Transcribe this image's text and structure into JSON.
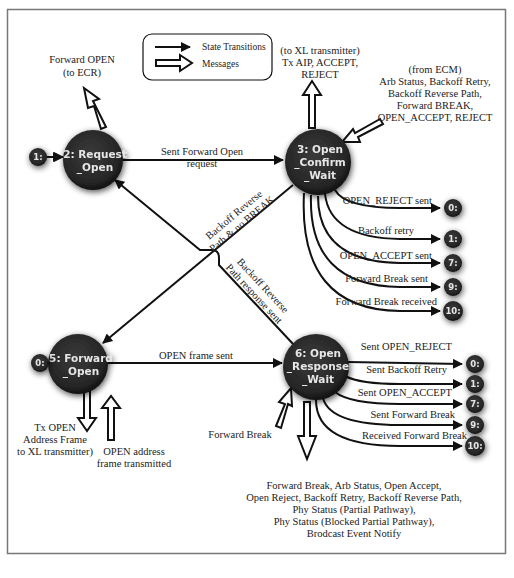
{
  "legend": {
    "state_transitions": "State Transitions",
    "messages": "Messages"
  },
  "states": {
    "request_open": {
      "line1": "2: Request",
      "line2": "_Open"
    },
    "open_confirm_wait": {
      "line1": "3: Open",
      "line2": "_Confirm",
      "line3": "_Wait"
    },
    "forward_open": {
      "line1": "5: Forward",
      "line2": "_Open"
    },
    "open_response_wait": {
      "line1": "6: Open",
      "line2": "_Response",
      "line3": "_Wait"
    }
  },
  "entry_states": {
    "to_request_open": "1:",
    "to_forward_open": "0:"
  },
  "transitions": {
    "request_to_confirm": {
      "line1": "Sent Forward Open",
      "line2": "request"
    },
    "confirm_to_forward": {
      "line1": "Backoff Reverse",
      "line2": "Path & no BREAK"
    },
    "response_to_request": {
      "line1": "Backoff Reverse",
      "line2": "Path response sent"
    },
    "forward_to_response": "OPEN frame sent"
  },
  "confirm_exits": [
    {
      "label": "OPEN_REJECT sent",
      "target": "0:"
    },
    {
      "label": "Backoff retry",
      "target": "1:"
    },
    {
      "label": "OPEN_ACCEPT sent",
      "target": "7:"
    },
    {
      "label": "Forward Break sent",
      "target": "9:"
    },
    {
      "label": "Forward Break received",
      "target": "10:"
    }
  ],
  "response_exits": [
    {
      "label": "Sent OPEN_REJECT",
      "target": "0:"
    },
    {
      "label": "Sent Backoff Retry",
      "target": "1:"
    },
    {
      "label": "Sent OPEN_ACCEPT",
      "target": "7:"
    },
    {
      "label": "Sent Forward Break",
      "target": "9:"
    },
    {
      "label": "Received Forward Break",
      "target": "10:"
    }
  ],
  "messages": {
    "request_open_out": {
      "line1": "Forward OPEN",
      "line2": "(to ECR)"
    },
    "confirm_out": {
      "line1": "(to XL transmitter)",
      "line2": "Tx AIP, ACCEPT,",
      "line3": "REJECT"
    },
    "confirm_in": {
      "line1": "(from ECM)",
      "line2": "Arb Status, Backoff Retry,",
      "line3": "Backoff Reverse Path,",
      "line4": "Forward BREAK,",
      "line5": "OPEN_ACCEPT, REJECT"
    },
    "forward_out": {
      "line1": "Tx OPEN",
      "line2": "Address Frame",
      "line3": "to XL transmitter)"
    },
    "forward_in": {
      "line1": "OPEN address",
      "line2": "frame transmitted"
    },
    "response_in": "Forward Break",
    "response_out": {
      "line1": "Forward Break, Arb Status, Open Accept,",
      "line2": "Open Reject, Backoff Retry, Backoff Reverse Path,",
      "line3": "Phy Status (Partial Pathway),",
      "line4": "Phy Status (Blocked Partial Pathway),",
      "line5": "Brodcast Event Notify"
    }
  },
  "colors": {
    "node_fill": "#2b2b2b",
    "node_text": "#e6e6e6",
    "line": "#111111",
    "frame": "#777777"
  }
}
